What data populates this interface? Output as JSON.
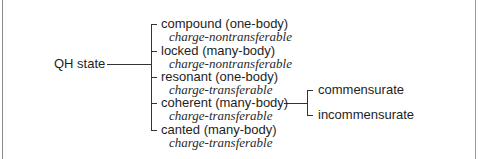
{
  "diagram": {
    "root": {
      "label": "QH state"
    },
    "branches": [
      {
        "label": "compound (one-body)",
        "property": "charge-nontransferable"
      },
      {
        "label": "locked (many-body)",
        "property": "charge-nontransferable"
      },
      {
        "label": "resonant (one-body)",
        "property": "charge-transferable"
      },
      {
        "label": "coherent (many-body)",
        "property": "charge-transferable",
        "children": [
          {
            "label": "commensurate"
          },
          {
            "label": "incommensurate"
          }
        ]
      },
      {
        "label": "canted (many-body)",
        "property": "charge-transferable"
      }
    ],
    "colors": {
      "text": "#1e1e1e",
      "line": "#333333",
      "frame": "#8a8a8a"
    }
  }
}
